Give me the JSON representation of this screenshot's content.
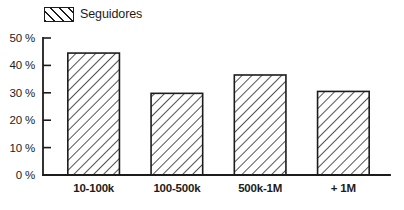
{
  "legend": {
    "swatch_icon": "hatch-swatch-icon",
    "label": "Seguidores",
    "position": "top-left"
  },
  "colors": {
    "stroke": "#1c1c1c",
    "background": "#ffffff",
    "fill": "#ffffff"
  },
  "chart_data": {
    "type": "bar",
    "title": "",
    "subtitle": "",
    "xlabel": "",
    "ylabel": "",
    "categories": [
      "10-100k",
      "100-500k",
      "500k-1M",
      "+ 1M"
    ],
    "values": [
      44.5,
      29.8,
      36.5,
      30.5
    ],
    "series": [
      {
        "name": "Seguidores",
        "values": [
          44.5,
          29.8,
          36.5,
          30.5
        ]
      }
    ],
    "ylim": [
      0,
      50
    ],
    "ytick_values": [
      0,
      10,
      20,
      30,
      40,
      50
    ],
    "ytick_labels": [
      "0 %",
      "10 %",
      "20 %",
      "30 %",
      "40 %",
      "50 %"
    ],
    "xtick_labels": [
      "10-100k",
      "100-500k",
      "500k-1M",
      "+ 1M"
    ],
    "grid": false,
    "legend_position": "top-left",
    "bar_fill": "diagonal-hatch",
    "units": "%"
  }
}
